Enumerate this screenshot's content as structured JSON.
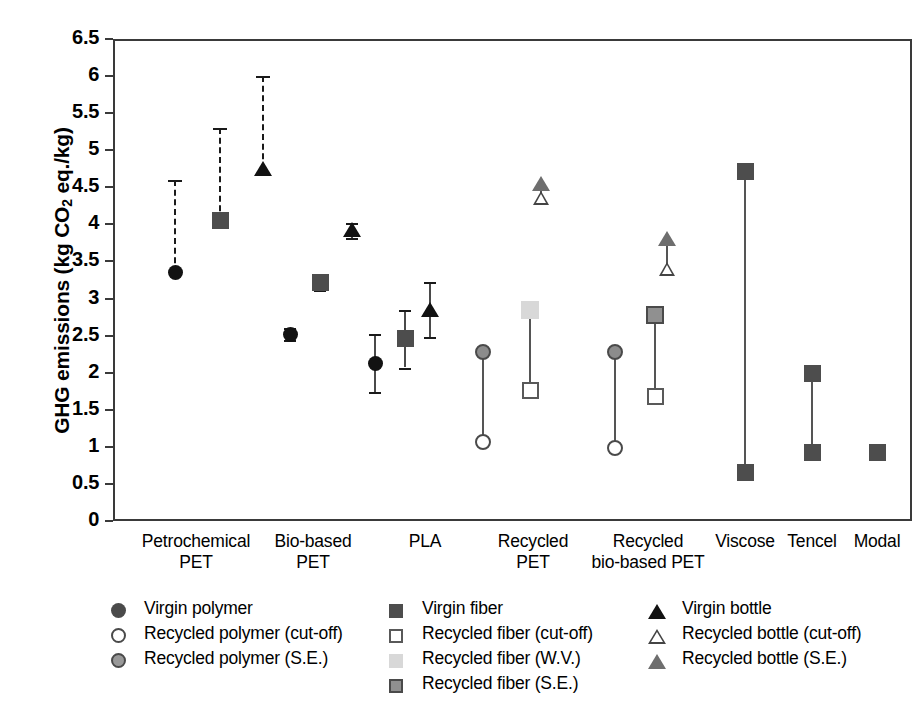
{
  "chart_data": {
    "type": "scatter",
    "title": "",
    "xlabel": "",
    "ylabel": "GHG emissions (kg CO2 eq./kg)",
    "ylabel_parts": {
      "pre": "GHG emissions (kg CO",
      "sub": "2",
      "post": " eq./kg)"
    },
    "ylim": [
      0,
      6.5
    ],
    "ytick_step": 0.5,
    "yticks": [
      "6.5",
      "6",
      "5.5",
      "5",
      "4.5",
      "4",
      "3.5",
      "3",
      "2.5",
      "2",
      "1.5",
      "1",
      "0.5",
      "0"
    ],
    "grid": false,
    "legend_position": "below-plot",
    "categories": [
      "Petrochemical PET",
      "Bio-based PET",
      "PLA",
      "Recycled PET",
      "Recycled bio-based PET",
      "Viscose",
      "Tencel",
      "Modal"
    ],
    "category_labels": [
      {
        "line1": "Petrochemical",
        "line2": "PET"
      },
      {
        "line1": "Bio-based",
        "line2": "PET"
      },
      {
        "line1": "PLA",
        "line2": ""
      },
      {
        "line1": "Recycled",
        "line2": "PET"
      },
      {
        "line1": "Recycled",
        "line2": "bio-based PET"
      },
      {
        "line1": "Viscose",
        "line2": ""
      },
      {
        "line1": "Tencel",
        "line2": ""
      },
      {
        "line1": "Modal",
        "line2": ""
      }
    ],
    "series": [
      {
        "name": "Virgin polymer",
        "marker": "circle-filled",
        "values": [
          3.35,
          2.52,
          2.12,
          null,
          null,
          null,
          null,
          null
        ]
      },
      {
        "name": "Recycled polymer (cut-off)",
        "marker": "circle-open",
        "values": [
          null,
          null,
          null,
          1.07,
          0.99,
          null,
          null,
          null
        ]
      },
      {
        "name": "Recycled polymer (S.E.)",
        "marker": "circle-gray",
        "values": [
          null,
          null,
          null,
          2.28,
          2.28,
          null,
          null,
          null
        ]
      },
      {
        "name": "Virgin fiber",
        "marker": "square-dark",
        "values": [
          4.05,
          3.21,
          2.46,
          null,
          null,
          4.71,
          1.99,
          0.92
        ]
      },
      {
        "name": "Recycled fiber (cut-off)",
        "marker": "square-open",
        "values": [
          null,
          null,
          null,
          1.76,
          1.68,
          null,
          null,
          null
        ]
      },
      {
        "name": "Recycled fiber (W.V.)",
        "marker": "square-light",
        "values": [
          null,
          null,
          null,
          2.85,
          null,
          null,
          null,
          null
        ]
      },
      {
        "name": "Recycled fiber (S.E.)",
        "marker": "square-gray",
        "values": [
          null,
          null,
          null,
          null,
          2.78,
          null,
          null,
          null
        ]
      },
      {
        "name": "Virgin bottle",
        "marker": "triangle-filled",
        "values": [
          4.75,
          3.92,
          2.85,
          null,
          null,
          null,
          null,
          null
        ]
      },
      {
        "name": "Recycled bottle (cut-off)",
        "marker": "triangle-open",
        "values": [
          null,
          null,
          null,
          4.35,
          3.4,
          null,
          null,
          null
        ]
      },
      {
        "name": "Recycled bottle (S.E.)",
        "marker": "triangle-gray",
        "values": [
          null,
          null,
          null,
          4.55,
          3.8,
          null,
          null,
          null
        ]
      }
    ],
    "ranges": [
      {
        "category": "Petrochemical PET",
        "series": "Virgin polymer",
        "low": 3.35,
        "high": 4.6,
        "style": "dashed"
      },
      {
        "category": "Petrochemical PET",
        "series": "Virgin fiber",
        "low": 4.05,
        "high": 5.3,
        "style": "dashed"
      },
      {
        "category": "Petrochemical PET",
        "series": "Virgin bottle",
        "low": 4.75,
        "high": 6.0,
        "style": "dashed"
      },
      {
        "category": "Bio-based PET",
        "series": "Virgin polymer",
        "low": 2.44,
        "high": 2.6,
        "style": "errorbar"
      },
      {
        "category": "Bio-based PET",
        "series": "Virgin fiber",
        "low": 3.12,
        "high": 3.31,
        "style": "errorbar"
      },
      {
        "category": "Bio-based PET",
        "series": "Virgin bottle",
        "low": 3.82,
        "high": 4.02,
        "style": "errorbar"
      },
      {
        "category": "PLA",
        "series": "Virgin polymer",
        "low": 1.74,
        "high": 2.52,
        "style": "errorbar"
      },
      {
        "category": "PLA",
        "series": "Virgin fiber",
        "low": 2.07,
        "high": 2.85,
        "style": "errorbar"
      },
      {
        "category": "PLA",
        "series": "Virgin bottle",
        "low": 2.48,
        "high": 3.22,
        "style": "errorbar"
      },
      {
        "category": "Recycled PET",
        "series": "polymer-link",
        "low": 1.07,
        "high": 2.28,
        "style": "connector"
      },
      {
        "category": "Recycled PET",
        "series": "fiber-link",
        "low": 1.76,
        "high": 2.85,
        "style": "connector"
      },
      {
        "category": "Recycled PET",
        "series": "bottle-link",
        "low": 4.35,
        "high": 4.55,
        "style": "connector"
      },
      {
        "category": "Recycled bio-based PET",
        "series": "polymer-link",
        "low": 0.99,
        "high": 2.28,
        "style": "connector"
      },
      {
        "category": "Recycled bio-based PET",
        "series": "fiber-link",
        "low": 1.68,
        "high": 2.78,
        "style": "connector"
      },
      {
        "category": "Recycled bio-based PET",
        "series": "bottle-link",
        "low": 3.4,
        "high": 3.8,
        "style": "connector"
      },
      {
        "category": "Viscose",
        "series": "Virgin fiber",
        "low": 0.65,
        "high": 4.71,
        "style": "connector"
      },
      {
        "category": "Tencel",
        "series": "Virgin fiber",
        "low": 0.92,
        "high": 1.99,
        "style": "connector"
      }
    ]
  },
  "legend": {
    "columns": [
      {
        "items": [
          {
            "marker": "circle-filled",
            "label": "Virgin polymer"
          },
          {
            "marker": "circle-open",
            "label": "Recycled polymer (cut-off)"
          },
          {
            "marker": "circle-gray",
            "label": "Recycled polymer (S.E.)"
          }
        ]
      },
      {
        "items": [
          {
            "marker": "square-dark",
            "label": "Virgin fiber"
          },
          {
            "marker": "square-open",
            "label": "Recycled fiber (cut-off)"
          },
          {
            "marker": "square-light",
            "label": "Recycled fiber (W.V.)"
          },
          {
            "marker": "square-gray",
            "label": "Recycled fiber (S.E.)"
          }
        ]
      },
      {
        "items": [
          {
            "marker": "triangle-filled",
            "label": "Virgin bottle"
          },
          {
            "marker": "triangle-open",
            "label": "Recycled bottle (cut-off)"
          },
          {
            "marker": "triangle-gray",
            "label": "Recycled bottle (S.E.)"
          }
        ]
      }
    ]
  },
  "colors": {
    "axis": "#3a3a3a",
    "filled": "#121212",
    "dark_gray": "#4d4d4d",
    "mid_gray": "#909090",
    "light_gray": "#d8d8d8",
    "background": "#ffffff"
  }
}
